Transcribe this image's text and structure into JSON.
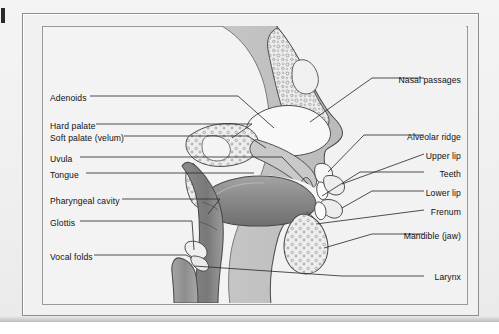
{
  "figure": {
    "type": "anatomical-diagram",
    "frame": {
      "outer": true,
      "inner": true
    },
    "background_color": "#f1f1f1",
    "line_color": "#333333",
    "label_color": "#111111"
  },
  "labels": {
    "left": [
      {
        "id": "adenoids",
        "text": "Adenoids",
        "x": 8,
        "y": 96,
        "leader_to_x": 205,
        "leader_to_y": 96
      },
      {
        "id": "hard-palate",
        "text": "Hard palate",
        "x": 8,
        "y": 124,
        "leader_to_x": 205,
        "leader_to_y": 118
      },
      {
        "id": "soft-palate",
        "text": "Soft palate (velum)",
        "x": 8,
        "y": 136,
        "leader_to_x": 205,
        "leader_to_y": 131
      },
      {
        "id": "uvula",
        "text": "Uvula",
        "x": 8,
        "y": 157,
        "leader_to_x": 205,
        "leader_to_y": 150
      },
      {
        "id": "tongue",
        "text": "Tongue",
        "x": 8,
        "y": 173,
        "leader_to_x": 205,
        "leader_to_y": 168
      },
      {
        "id": "pharyngeal-cavity",
        "text": "Pharyngeal cavity",
        "x": 8,
        "y": 199,
        "leader_to_x": 205,
        "leader_to_y": 197
      },
      {
        "id": "glottis",
        "text": "Glottis",
        "x": 8,
        "y": 221,
        "leader_to_x": 205,
        "leader_to_y": 219
      },
      {
        "id": "vocal-folds",
        "text": "Vocal folds",
        "x": 8,
        "y": 255,
        "leader_to_x": 205,
        "leader_to_y": 252
      }
    ],
    "right": [
      {
        "id": "nasal-passages",
        "text": "Nasal passages",
        "x": 388,
        "y": 78
      },
      {
        "id": "alveolar-ridge",
        "text": "Alveolar ridge",
        "x": 395,
        "y": 135
      },
      {
        "id": "upper-lip",
        "text": "Upper lip",
        "x": 418,
        "y": 154
      },
      {
        "id": "teeth",
        "text": "Teeth",
        "x": 437,
        "y": 172
      },
      {
        "id": "lower-lip",
        "text": "Lower lip",
        "x": 418,
        "y": 191
      },
      {
        "id": "frenum",
        "text": "Frenum",
        "x": 427,
        "y": 210
      },
      {
        "id": "mandible-jaw",
        "text": "Mandible (jaw)",
        "x": 390,
        "y": 234
      },
      {
        "id": "larynx",
        "text": "Larynx",
        "x": 432,
        "y": 275
      }
    ]
  },
  "anatomy": {
    "regions": [
      {
        "id": "head-silhouette",
        "name": "Head profile (skin/soft tissue)",
        "fill": "#bdbdbd"
      },
      {
        "id": "nasal-cavity",
        "name": "Nasal cavity",
        "fill": "#f7f7f7"
      },
      {
        "id": "nasal-bone",
        "name": "Nasal bone (spongy)",
        "fill": "#e8e8e8"
      },
      {
        "id": "hard-palate-bone",
        "name": "Hard palate bone",
        "fill": "#e4e4e4"
      },
      {
        "id": "tongue-body",
        "name": "Tongue",
        "fill": "#8e8e8e"
      },
      {
        "id": "pharynx-airway",
        "name": "Pharyngeal airway",
        "fill": "#f5f5f5"
      },
      {
        "id": "pharynx-wall",
        "name": "Pharyngeal wall",
        "fill": "#858585"
      },
      {
        "id": "mandible-bone",
        "name": "Mandible bone",
        "fill": "#e6e6e6"
      },
      {
        "id": "lips",
        "name": "Lips",
        "fill": "#f2f2f2"
      },
      {
        "id": "larynx-trachea",
        "name": "Larynx / trachea",
        "fill": "#9a9a9a"
      },
      {
        "id": "vocal-fold-pair",
        "name": "Vocal folds",
        "fill": "#efefef"
      }
    ]
  }
}
